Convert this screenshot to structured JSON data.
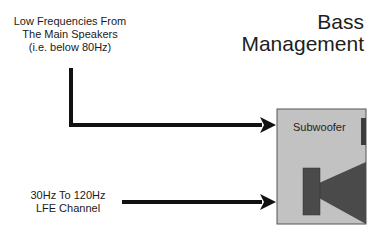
{
  "title": {
    "line1": "Bass",
    "line2": "Management"
  },
  "inputs": [
    {
      "line1": "Low Frequencies From",
      "line2": "The Main  Speakers",
      "line3": "(i.e. below 80Hz)"
    },
    {
      "line1": "30Hz To 120Hz",
      "line2": "LFE Channel"
    }
  ],
  "subwoofer": {
    "label": "Subwoofer",
    "box_color": "#c2c2c2",
    "driver_color": "#4a4a4a"
  },
  "arrow_color": "#111111"
}
